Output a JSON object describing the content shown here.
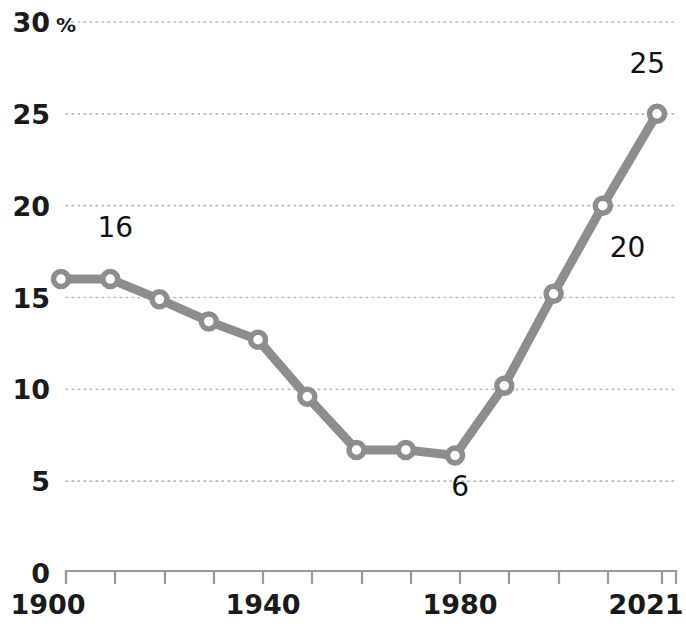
{
  "chart_data": {
    "type": "line",
    "title": "",
    "subtitle": "",
    "xlabel": "",
    "ylabel": "",
    "y_unit_label": "%",
    "xlim": [
      1900,
      2021
    ],
    "ylim": [
      0,
      30
    ],
    "grid": true,
    "legend": "none",
    "y_ticks": [
      0,
      5,
      10,
      15,
      20,
      25,
      30
    ],
    "y_tick_labels": [
      "0",
      "5",
      "10",
      "15",
      "20",
      "25",
      "30"
    ],
    "x_ticks": [
      1900,
      1910,
      1920,
      1930,
      1940,
      1950,
      1960,
      1970,
      1980,
      1990,
      2000,
      2010,
      2021
    ],
    "x_tick_labels": [
      "1900",
      "",
      "",
      "",
      "1940",
      "",
      "",
      "",
      "1980",
      "",
      "",
      "",
      "2021"
    ],
    "x_labeled_ticks": [
      {
        "value": 1900,
        "label": "1900"
      },
      {
        "value": 1940,
        "label": "1940"
      },
      {
        "value": 1980,
        "label": "1980"
      },
      {
        "value": 2021,
        "label": "2021"
      }
    ],
    "series": [
      {
        "name": "share",
        "color": "#8d8d8d",
        "marker": "circle-open",
        "x": [
          1900,
          1910,
          1920,
          1930,
          1940,
          1950,
          1960,
          1970,
          1980,
          1990,
          2000,
          2010,
          2021
        ],
        "values": [
          16,
          16,
          14.9,
          13.7,
          12.7,
          9.6,
          6.7,
          6.7,
          6.4,
          10.2,
          15.2,
          20,
          25
        ]
      }
    ],
    "annotations": [
      {
        "text": "16",
        "x": 1910,
        "y": 18.3
      },
      {
        "text": "6",
        "x": 1980,
        "y": 4.2
      },
      {
        "text": "20",
        "x": 2014,
        "y": 17.2
      },
      {
        "text": "25",
        "x": 2018,
        "y": 27.2
      }
    ]
  },
  "colors": {
    "line": "#8d8d8d",
    "marker_fill": "#ffffff",
    "grid": "#b9b9b9",
    "axis": "#9a9a9a",
    "text": "#1a1a1a",
    "background": "#ffffff"
  }
}
